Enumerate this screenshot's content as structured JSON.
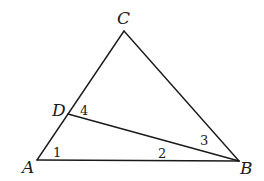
{
  "diagram": {
    "type": "triangle",
    "vertices": [
      {
        "id": "A",
        "label": "A",
        "x": 37,
        "y": 160,
        "label_x": 22,
        "label_y": 173
      },
      {
        "id": "B",
        "label": "B",
        "x": 239,
        "y": 161,
        "label_x": 240,
        "label_y": 174
      },
      {
        "id": "C",
        "label": "C",
        "x": 124,
        "y": 31,
        "label_x": 117,
        "label_y": 24
      },
      {
        "id": "D",
        "label": "D",
        "x": 68,
        "y": 114,
        "label_x": 52,
        "label_y": 116
      }
    ],
    "segments": [
      {
        "from": "A",
        "to": "B"
      },
      {
        "from": "B",
        "to": "C"
      },
      {
        "from": "C",
        "to": "A"
      },
      {
        "from": "D",
        "to": "B"
      }
    ],
    "angle_labels": [
      {
        "label": "1",
        "x": 53,
        "y": 157
      },
      {
        "label": "2",
        "x": 158,
        "y": 158
      },
      {
        "label": "3",
        "x": 200,
        "y": 145
      },
      {
        "label": "4",
        "x": 80,
        "y": 115
      }
    ],
    "stroke_color": "#1a1a1a",
    "background": "#ffffff"
  }
}
